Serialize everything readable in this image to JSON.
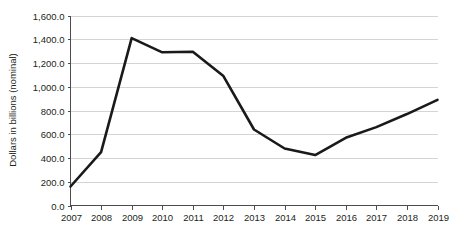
{
  "chart_data": {
    "type": "line",
    "title": "",
    "subtitle": "",
    "xlabel": "",
    "ylabel": "Dollars in billions (nominal)",
    "categories": [
      "2007",
      "2008",
      "2009",
      "2010",
      "2011",
      "2012",
      "2013",
      "2014",
      "2015",
      "2016",
      "2017",
      "2018",
      "2019"
    ],
    "x": [
      2007,
      2008,
      2009,
      2010,
      2011,
      2012,
      2013,
      2014,
      2015,
      2016,
      2017,
      2018,
      2019
    ],
    "values": [
      160.0,
      450.0,
      1410.0,
      1290.0,
      1295.0,
      1090.0,
      640.0,
      480.0,
      425.0,
      570.0,
      660.0,
      770.0,
      890.0
    ],
    "series": [
      {
        "name": "Dollars in billions (nominal)",
        "values": [
          160.0,
          450.0,
          1410.0,
          1290.0,
          1295.0,
          1090.0,
          640.0,
          480.0,
          425.0,
          570.0,
          660.0,
          770.0,
          890.0
        ],
        "color": "#1a1a1a"
      }
    ],
    "ylim": [
      0,
      1600
    ],
    "ytick_step": 200,
    "ytick_labels": [
      "0.0",
      "200.0",
      "400.0",
      "600.0",
      "800.0",
      "1,000.0",
      "1,200.0",
      "1,400.0",
      "1,600.0"
    ],
    "ytick_values": [
      0,
      200,
      400,
      600,
      800,
      1000,
      1200,
      1400,
      1600
    ],
    "xtick_labels": [
      "2007",
      "2008",
      "2009",
      "2010",
      "2011",
      "2012",
      "2013",
      "2014",
      "2015",
      "2016",
      "2017",
      "2018",
      "2019"
    ],
    "grid": true,
    "grid_axis": "y",
    "legend": false,
    "legend_position": "none",
    "annotations": [],
    "colors": {
      "line": "#1a1a1a",
      "gridline": "#c9c9c9",
      "axis": "#4d4d4d",
      "text": "#231f20",
      "background": "#ffffff"
    }
  }
}
